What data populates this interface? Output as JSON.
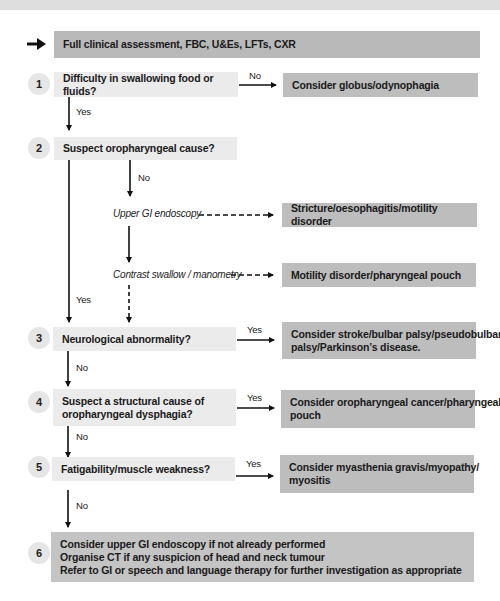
{
  "flowchart": {
    "start": {
      "label": "Full clinical assessment, FBC, U&Es, LFTs, CXR"
    },
    "steps": [
      {
        "number": "1",
        "question": "Difficulty in swallowing food or fluids?",
        "branch_label": "No",
        "result": "Consider globus/odynophagia",
        "next_label": "Yes"
      },
      {
        "number": "2",
        "question": "Suspect oropharyngeal cause?",
        "branch_label": "No",
        "next_label": "Yes"
      },
      {
        "number": "3",
        "question": "Neurological abnormality?",
        "branch_label": "Yes",
        "result_lines": [
          "Consider stroke/bulbar palsy/pseudobulbar",
          "palsy/Parkinson’s disease."
        ],
        "next_label": "No"
      },
      {
        "number": "4",
        "question_lines": [
          "Suspect a structural cause of",
          "oropharyngeal dysphagia?"
        ],
        "branch_label": "Yes",
        "result_lines": [
          "Consider oropharyngeal cancer/pharyngeal",
          "pouch"
        ],
        "next_label": "No"
      },
      {
        "number": "5",
        "question": "Fatigability/muscle weakness?",
        "branch_label": "Yes",
        "result_lines": [
          "Consider myasthenia gravis/myopathy/",
          "myositis"
        ],
        "next_label": "No"
      },
      {
        "number": "6",
        "actions": [
          "Consider upper GI endoscopy if not already performed",
          "Organise CT if any suspicion of head and neck tumour",
          "Refer to GI or speech and language therapy for further investigation as appropriate"
        ]
      }
    ],
    "investigations": [
      {
        "label": "Upper GI endoscopy",
        "result": "Stricture/oesophagitis/motility disorder"
      },
      {
        "label": "Contrast swallow / manometry",
        "result": "Motility disorder/pharyngeal pouch"
      }
    ]
  },
  "colors": {
    "question_box": "#ebebeb",
    "result_box": "#bdbdbd",
    "header_box": "#b9b9b9",
    "circle": "#e6e6e6",
    "line": "#111111"
  }
}
